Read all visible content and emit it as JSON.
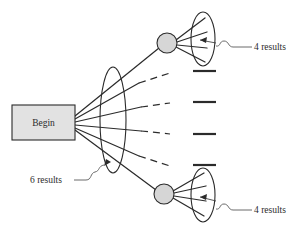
{
  "diagram": {
    "start_node": {
      "label": "Begin",
      "shape": "rectangle",
      "fill": "#e2e2e2",
      "stroke": "#2b2b2b"
    },
    "annotations": [
      {
        "id": "ann-left",
        "text": "6 results",
        "points_to": "left-result-set"
      },
      {
        "id": "ann-top",
        "text": "4 results",
        "points_to": "top-result-set"
      },
      {
        "id": "ann-bottom",
        "text": "4 results",
        "points_to": "bottom-result-set"
      }
    ],
    "result_sets": [
      {
        "id": "left-result-set",
        "count": 6,
        "shape": "ellipse"
      },
      {
        "id": "top-result-set",
        "count": 4,
        "shape": "ellipse"
      },
      {
        "id": "bottom-result-set",
        "count": 4,
        "shape": "ellipse"
      }
    ],
    "expanded_nodes": [
      {
        "id": "top-node",
        "shape": "circle",
        "fill": "#d6d6d6"
      },
      {
        "id": "bottom-node",
        "shape": "circle",
        "fill": "#d6d6d6"
      }
    ],
    "unexpanded_markers": {
      "count": 4,
      "style": "horizontal-bar"
    },
    "edge_styles": {
      "expanded": "solid",
      "unexpanded": "solid-to-dashed"
    },
    "colors": {
      "ink": "#2b2b2b",
      "node_fill": "#d6d6d6",
      "box_fill": "#e2e2e2",
      "leader": "#5a5a5a",
      "background": "#ffffff"
    }
  }
}
